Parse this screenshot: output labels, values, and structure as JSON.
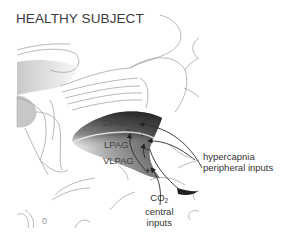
{
  "title": "HEALTHY SUBJECT",
  "regions": {
    "dpag": "DPAG",
    "lpag": "LPAG",
    "vlpag": "VLPAG"
  },
  "signs": {
    "dpag_minus": "−",
    "dpag_plus": "+",
    "lpag_minus": "−",
    "vlpag_plus": "+"
  },
  "peripheral_label": {
    "line1": "hypercapnia",
    "line2": "peripheral inputs"
  },
  "central_label": {
    "line1_prefix": "CO",
    "line1_sub": "2",
    "line2": "central",
    "line3": "inputs"
  },
  "corner_mark": "0",
  "colors": {
    "outline": "#9a9a9a",
    "shade_dark": "#3c3c3c",
    "shade_light": "#e6e6e6",
    "arrow": "#2a2a2a",
    "text": "#3a3a3a"
  }
}
